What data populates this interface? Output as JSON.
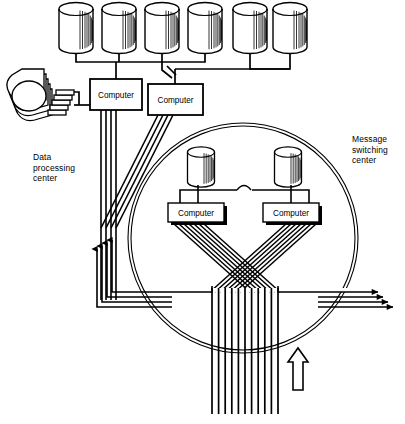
{
  "diagram": {
    "background": "#ffffff",
    "ink": "#000000",
    "labels": {
      "data_processing_center": "Data\nprocessing\ncenter",
      "message_switching_center": "Message\nswitching\ncenter"
    },
    "data_processing_center": {
      "disk_count": 6,
      "disks": [
        {
          "id": "disk-1",
          "cx": 76,
          "cy": 28
        },
        {
          "id": "disk-2",
          "cx": 119,
          "cy": 28
        },
        {
          "id": "disk-3",
          "cx": 162,
          "cy": 28
        },
        {
          "id": "disk-4",
          "cx": 205,
          "cy": 28
        },
        {
          "id": "disk-5",
          "cx": 250,
          "cy": 28
        },
        {
          "id": "disk-6",
          "cx": 290,
          "cy": 28
        }
      ],
      "computers": [
        {
          "id": "dp-computer-left",
          "label": "Computer",
          "x": 90,
          "y": 79,
          "w": 52,
          "h": 31
        },
        {
          "id": "dp-computer-right",
          "label": "Computer",
          "x": 148,
          "y": 84,
          "w": 55,
          "h": 31
        }
      ],
      "terminal_stack": {
        "id": "terminal-stack",
        "count": 6,
        "cx": 32,
        "cy": 100
      }
    },
    "message_switching_center": {
      "circle": {
        "cx": 243,
        "cy": 238,
        "r": 115
      },
      "disks": [
        {
          "id": "msc-disk-left",
          "cx": 201,
          "cy": 167
        },
        {
          "id": "msc-disk-right",
          "cx": 288,
          "cy": 167
        }
      ],
      "computers": [
        {
          "id": "msc-computer-left",
          "label": "Computer",
          "x": 168,
          "y": 203,
          "w": 56,
          "h": 19
        },
        {
          "id": "msc-computer-right",
          "label": "Computer",
          "x": 263,
          "y": 203,
          "w": 56,
          "h": 19
        }
      ]
    },
    "trunk": {
      "id": "main-trunk",
      "line_count": 11,
      "x_start": 212,
      "x_end": 278,
      "y_top": 288,
      "y_bottom": 414
    },
    "incoming_arrow": {
      "id": "incoming-arrow-up",
      "x": 278,
      "y": 370,
      "direction": "up"
    },
    "outgoing_arrows_right": {
      "count": 4,
      "direction": "right"
    },
    "return_lines_left": {
      "count": 4,
      "direction": "up"
    }
  }
}
